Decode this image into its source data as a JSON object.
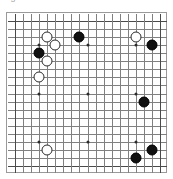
{
  "caption": {
    "text": "Figure"
  },
  "board": {
    "size": 19,
    "label": "go-board",
    "line_color": "#808080",
    "edge_color": "#4a4a4a",
    "background": "#ffffff",
    "black_color": "#111111",
    "white_color": "#ffffff",
    "star_points": [
      {
        "col": 4,
        "row": 4
      },
      {
        "col": 10,
        "row": 4
      },
      {
        "col": 16,
        "row": 4
      },
      {
        "col": 4,
        "row": 10
      },
      {
        "col": 10,
        "row": 10
      },
      {
        "col": 16,
        "row": 10
      },
      {
        "col": 4,
        "row": 16
      },
      {
        "col": 10,
        "row": 16
      },
      {
        "col": 16,
        "row": 16
      }
    ],
    "stones": [
      {
        "color": "white",
        "col": 5,
        "row": 3,
        "label": "W-E17"
      },
      {
        "color": "white",
        "col": 6,
        "row": 4,
        "label": "W-F16"
      },
      {
        "color": "black",
        "col": 4,
        "row": 5,
        "label": "B-D15"
      },
      {
        "color": "white",
        "col": 5,
        "row": 6,
        "label": "W-E14"
      },
      {
        "color": "white",
        "col": 4,
        "row": 8,
        "label": "W-D12"
      },
      {
        "color": "black",
        "col": 9,
        "row": 3,
        "label": "B-J17"
      },
      {
        "color": "white",
        "col": 16,
        "row": 3,
        "label": "W-Q17"
      },
      {
        "color": "black",
        "col": 18,
        "row": 4,
        "label": "B-S16"
      },
      {
        "color": "black",
        "col": 17,
        "row": 11,
        "label": "B-R9"
      },
      {
        "color": "white",
        "col": 5,
        "row": 17,
        "label": "W-E3"
      },
      {
        "color": "black",
        "col": 18,
        "row": 17,
        "label": "B-S3"
      },
      {
        "color": "black",
        "col": 16,
        "row": 18,
        "label": "B-Q2"
      }
    ]
  }
}
